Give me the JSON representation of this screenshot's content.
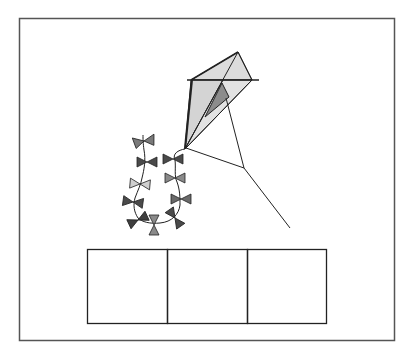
{
  "figure": {
    "frame": {
      "x": 19,
      "y": 18,
      "w": 376,
      "h": 323,
      "stroke": "#555555"
    },
    "kite": {
      "sail_fill": "#d9d9d9",
      "inner_fill": "#8c8c8c",
      "line_color": "#222222"
    },
    "bows": {
      "colors": {
        "dark": "#4a4a4a",
        "mid": "#8a8a8a",
        "light": "#c8c8c8"
      },
      "count": 12
    },
    "answer_boxes": {
      "count": 3,
      "x": 87,
      "y": 249,
      "w": 240,
      "h": 75,
      "labels": [
        "",
        "",
        ""
      ]
    }
  }
}
